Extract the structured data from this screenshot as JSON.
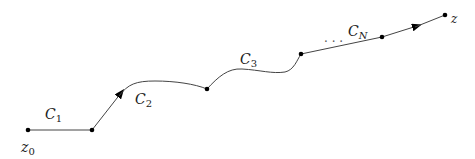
{
  "diagram": {
    "type": "path-of-contours",
    "points": [
      {
        "id": "z0",
        "x": 28,
        "y": 130
      },
      {
        "id": "p1",
        "x": 92,
        "y": 130
      },
      {
        "id": "p2",
        "x": 207,
        "y": 89
      },
      {
        "id": "p3",
        "x": 301,
        "y": 54
      },
      {
        "id": "p4",
        "x": 382,
        "y": 37
      },
      {
        "id": "z",
        "x": 445,
        "y": 15
      }
    ],
    "labels": {
      "start": {
        "base": "z",
        "sub": "0"
      },
      "end": {
        "base": "z"
      },
      "c1": {
        "base": "C",
        "sub": "1"
      },
      "c2": {
        "base": "C",
        "sub": "2"
      },
      "c3": {
        "base": "C",
        "sub": "3"
      },
      "cn": {
        "base": "C",
        "sub": "N"
      },
      "ellipsis": "· · ·"
    },
    "colors": {
      "stroke": "#444444",
      "dot": "#000000"
    }
  }
}
